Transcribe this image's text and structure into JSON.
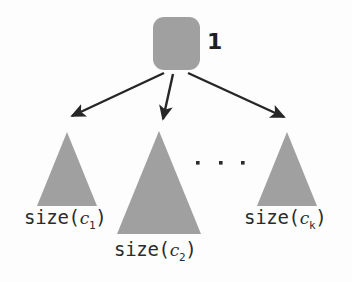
{
  "figure": {
    "name": "recursion-tree-size-decomposition",
    "background_color": "#fdfdfd",
    "shape_fill": "#a0a0a0",
    "ink_color": "#2b2b2b",
    "width": 352,
    "height": 282
  },
  "root": {
    "icon": "rounded-square-node",
    "count_label": "1",
    "x": 153,
    "y": 17,
    "width": 47,
    "height": 53
  },
  "edges": [
    {
      "name": "edge-to-child-1",
      "from_x": 164,
      "from_y": 73,
      "to_x": 70,
      "to_y": 117,
      "arrowhead": true
    },
    {
      "name": "edge-to-child-2",
      "from_x": 173,
      "from_y": 74,
      "to_x": 162,
      "to_y": 121,
      "arrowhead": true
    },
    {
      "name": "edge-to-child-k",
      "from_x": 188,
      "from_y": 73,
      "to_x": 286,
      "to_y": 118,
      "arrowhead": true
    }
  ],
  "subtrees": [
    {
      "name": "subtree-c1",
      "apex_x": 67,
      "apex_y": 132,
      "base_left_x": 37,
      "base_right_x": 97,
      "base_y": 206,
      "label_prefix": "size(",
      "label_var": "c",
      "label_index": "1",
      "label_suffix": ")",
      "label_text": "size(c1)"
    },
    {
      "name": "subtree-c2",
      "apex_x": 159,
      "apex_y": 131,
      "base_left_x": 117,
      "base_right_x": 201,
      "base_y": 234,
      "label_prefix": "size(",
      "label_var": "c",
      "label_index": "2",
      "label_suffix": ")",
      "label_text": "size(c2)"
    },
    {
      "name": "subtree-ck",
      "apex_x": 287,
      "apex_y": 132,
      "base_left_x": 257,
      "base_right_x": 317,
      "base_y": 206,
      "label_prefix": "size(",
      "label_var": "c",
      "label_index": "k",
      "label_suffix": ")",
      "label_text": "size(ck)"
    }
  ],
  "ellipsis": {
    "name": "ellipsis-between-subtrees",
    "dots": 3,
    "dot_positions": [
      {
        "x": 198,
        "y": 163
      },
      {
        "x": 221,
        "y": 163
      },
      {
        "x": 243,
        "y": 163
      }
    ],
    "text": "..."
  }
}
